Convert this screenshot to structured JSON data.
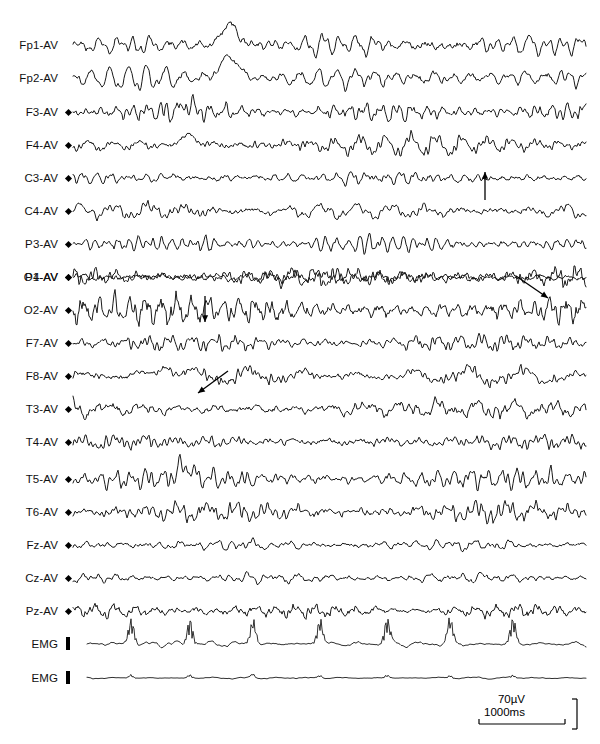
{
  "figure": {
    "kind": "eeg-polygraphy-recording",
    "width": 600,
    "height": 744,
    "montage": "average-reference",
    "background_color": "#ffffff",
    "trace_color": "#1a1a1a"
  },
  "channels": [
    {
      "label": "Fp1-AV",
      "marker": "none",
      "y": 45,
      "amp": 7.0,
      "freq": 1.3,
      "seed": 11,
      "spike": {
        "x": 232,
        "amp": 20,
        "w": 17
      },
      "thin": false
    },
    {
      "label": "Fp2-AV",
      "marker": "none",
      "y": 78,
      "amp": 6.4,
      "freq": 1.15,
      "seed": 23,
      "spike": {
        "x": 232,
        "amp": 19,
        "w": 19
      },
      "thin": false
    },
    {
      "label": "F3-AV",
      "marker": "diamond",
      "y": 112,
      "amp": 4.6,
      "freq": 1.85,
      "seed": 37,
      "spike": {
        "x": 188,
        "amp": 7,
        "w": 14
      },
      "thin": false
    },
    {
      "label": "F4-AV",
      "marker": "diamond",
      "y": 145,
      "amp": 5.0,
      "freq": 1.7,
      "seed": 51,
      "spike": {
        "x": 190,
        "amp": 10,
        "w": 16
      },
      "thin": false
    },
    {
      "label": "C3-AV",
      "marker": "diamond",
      "y": 178,
      "amp": 4.2,
      "freq": 2.1,
      "seed": 67,
      "spike": null,
      "thin": false
    },
    {
      "label": "C4-AV",
      "marker": "diamond",
      "y": 211,
      "amp": 5.2,
      "freq": 2.0,
      "seed": 83,
      "spike": null,
      "thin": false
    },
    {
      "label": "P3-AV",
      "marker": "diamond",
      "y": 244,
      "amp": 4.6,
      "freq": 2.25,
      "seed": 97,
      "spike": null,
      "thin": false
    },
    {
      "label": "P4-AV",
      "marker": "diamond",
      "y": 277,
      "amp": 5.0,
      "freq": 2.15,
      "seed": 113,
      "spike": null,
      "thin": false
    },
    {
      "label": "O1-AV",
      "marker": "diamond",
      "y": 277,
      "amp": 4.8,
      "freq": 2.4,
      "seed": 131,
      "spike": null,
      "thin": false
    },
    {
      "label": "O2-AV",
      "marker": "diamond",
      "y": 310,
      "amp": 7.6,
      "freq": 3.1,
      "seed": 149,
      "spike": null,
      "thin": false
    },
    {
      "label": "F7-AV",
      "marker": "diamond",
      "y": 343,
      "amp": 4.4,
      "freq": 2.0,
      "seed": 167,
      "spike": null,
      "thin": false
    },
    {
      "label": "F8-AV",
      "marker": "diamond",
      "y": 376,
      "amp": 5.6,
      "freq": 1.6,
      "seed": 181,
      "spike": {
        "x": 168,
        "amp": 11,
        "w": 18
      },
      "thin": false
    },
    {
      "label": "T3-AV",
      "marker": "diamond",
      "y": 409,
      "amp": 4.8,
      "freq": 2.05,
      "seed": 199,
      "spike": null,
      "thin": false
    },
    {
      "label": "T4-AV",
      "marker": "diamond",
      "y": 442,
      "amp": 5.2,
      "freq": 2.3,
      "seed": 211,
      "spike": null,
      "thin": false
    },
    {
      "label": "T5-AV",
      "marker": "diamond",
      "y": 479,
      "amp": 5.6,
      "freq": 2.2,
      "seed": 227,
      "spike": {
        "x": 186,
        "amp": 12,
        "w": 15
      },
      "thin": false
    },
    {
      "label": "T6-AV",
      "marker": "diamond",
      "y": 512,
      "amp": 5.4,
      "freq": 1.95,
      "seed": 241,
      "spike": null,
      "thin": false
    },
    {
      "label": "Fz-AV",
      "marker": "diamond",
      "y": 545,
      "amp": 3.8,
      "freq": 1.75,
      "seed": 257,
      "spike": null,
      "thin": false
    },
    {
      "label": "Cz-AV",
      "marker": "diamond",
      "y": 578,
      "amp": 3.6,
      "freq": 1.9,
      "seed": 271,
      "spike": null,
      "thin": false
    },
    {
      "label": "Pz-AV",
      "marker": "diamond",
      "y": 611,
      "amp": 4.2,
      "freq": 2.35,
      "seed": 283,
      "spike": null,
      "thin": false
    },
    {
      "label": "EMG",
      "marker": "bar",
      "y": 644,
      "amp": 1.5,
      "freq": 1.4,
      "seed": 307,
      "spike": null,
      "thin": true,
      "bursts": {
        "xs": [
          131,
          190,
          253,
          320,
          387,
          450,
          513
        ],
        "amp": 22,
        "spread": 3.2
      }
    },
    {
      "label": "EMG",
      "marker": "bar",
      "y": 678,
      "amp": 0.5,
      "freq": 1.2,
      "seed": 331,
      "spike": null,
      "thin": true,
      "bursts": {
        "xs": [
          131,
          190,
          253,
          320,
          387,
          450,
          513
        ],
        "amp": 3.0,
        "spread": 2.4
      }
    }
  ],
  "trace_area": {
    "x_start": 73,
    "x_end": 586,
    "label_right_edge": 58,
    "marker_x": 66
  },
  "annotations": [
    {
      "name": "arrow-up-c3",
      "type": "arrow",
      "x1": 485,
      "y1": 200,
      "x2": 485,
      "y2": 172
    },
    {
      "name": "arrow-down-right-o1",
      "type": "arrow",
      "x1": 516,
      "y1": 276,
      "x2": 548,
      "y2": 298
    },
    {
      "name": "arrow-down-o2",
      "type": "arrow",
      "x1": 205,
      "y1": 296,
      "x2": 205,
      "y2": 322
    },
    {
      "name": "arrow-down-left-f8",
      "type": "arrow",
      "x1": 228,
      "y1": 371,
      "x2": 198,
      "y2": 393
    }
  ],
  "scale_bar": {
    "time_label": "1000ms",
    "amplitude_label": "70µV",
    "time_x1": 479,
    "time_x2": 565,
    "time_y": 724,
    "amp_x": 577,
    "amp_y1": 699,
    "amp_y2": 729,
    "time_label_x": 484,
    "time_label_y": 716,
    "amp_label_x": 525,
    "amp_label_y": 703
  }
}
